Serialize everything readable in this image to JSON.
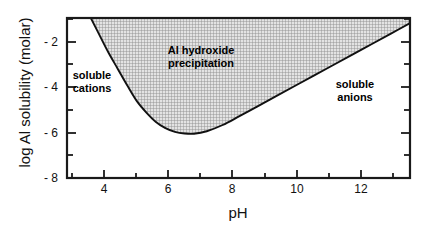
{
  "chart_data": {
    "type": "area",
    "title": "",
    "xlabel": "pH",
    "ylabel": "log Al solubility (molar)",
    "xlim": [
      2.8,
      13.6
    ],
    "ylim": [
      -8.55,
      -0.85
    ],
    "grid": false,
    "legend_position": "none",
    "x_major_ticks": [
      4,
      6,
      8,
      10,
      12
    ],
    "x_minor_ticks": [
      3,
      5,
      7,
      9,
      11,
      13
    ],
    "x_tick_labels": [
      "4",
      "6",
      "8",
      "10",
      "12"
    ],
    "y_major_ticks": [
      -2,
      -4,
      -6,
      -8
    ],
    "y_minor_ticks": [
      -1,
      -3,
      -5,
      -7
    ],
    "y_tick_labels": [
      "- 2",
      "- 4",
      "- 6",
      "- 8"
    ],
    "series": [
      {
        "name": "Al hydroxide solubility (left branch, cationic)",
        "x": [
          3.55,
          3.8,
          4.1,
          4.4,
          4.7,
          5.0,
          5.3,
          5.6,
          5.9,
          6.2,
          6.5,
          6.8
        ],
        "y": [
          -0.85,
          -1.6,
          -2.5,
          -3.3,
          -4.1,
          -4.85,
          -5.4,
          -5.85,
          -6.15,
          -6.33,
          -6.41,
          -6.42
        ]
      },
      {
        "name": "Al hydroxide solubility (right branch, anionic)",
        "x": [
          6.8,
          7.2,
          7.7,
          8.2,
          8.8,
          9.4,
          10.0,
          10.6,
          11.2,
          11.8,
          12.4,
          13.0,
          13.6
        ],
        "y": [
          -6.42,
          -6.3,
          -6.0,
          -5.6,
          -5.1,
          -4.6,
          -4.1,
          -3.6,
          -3.1,
          -2.6,
          -2.1,
          -1.6,
          -1.1
        ]
      }
    ],
    "shaded_region": {
      "label": "Al hydroxide precipitation",
      "fill": "crosshatch",
      "fill_color": "#b5b5b5"
    },
    "annotations": [
      {
        "text_line1": "Al  hydroxide",
        "text_line2": "precipitation",
        "x": 6.9,
        "y": -2.6
      },
      {
        "text_line1": "soluble",
        "text_line2": "cations",
        "x": 3.65,
        "y": -3.9
      },
      {
        "text_line1": "soluble",
        "text_line2": "anions",
        "x": 11.6,
        "y": -4.1
      }
    ],
    "minimum_point": {
      "x": 6.7,
      "y": -6.42
    }
  },
  "axes": {
    "x_title": "pH",
    "y_title": "log Al solubility (molar)",
    "frame_color": "#1a1a1a"
  },
  "labels": {
    "precipitation_line1": "Al  hydroxide",
    "precipitation_line2": "precipitation",
    "cations_line1": "soluble",
    "cations_line2": "cations",
    "anions_line1": "soluble",
    "anions_line2": "anions"
  },
  "y_ticks": [
    {
      "label": "- 2"
    },
    {
      "label": "- 4"
    },
    {
      "label": "- 6"
    },
    {
      "label": "- 8"
    }
  ],
  "x_ticks": [
    {
      "label": "4"
    },
    {
      "label": "6"
    },
    {
      "label": "8"
    },
    {
      "label": "10"
    },
    {
      "label": "12"
    }
  ]
}
